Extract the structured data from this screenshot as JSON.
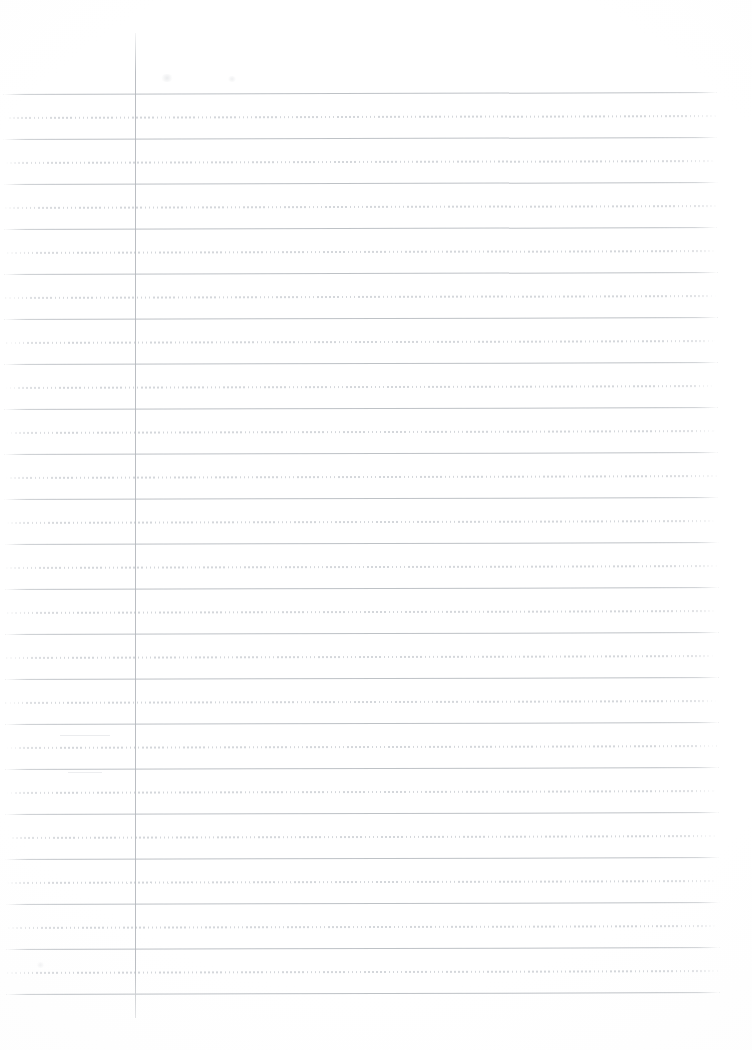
{
  "document": {
    "kind": "lined-notebook-paper-scan",
    "title": "Blank ruled notebook page",
    "page_width": 752,
    "page_height": 1050,
    "background_color": "#fefefe",
    "content_text": "",
    "handwriting_present": false
  },
  "ruling": {
    "solid_line_color": "#b9bdc2",
    "dotted_line_color": "#c9ccd1",
    "margin_line_color": "#b4b8bd",
    "line_pitch_px": 22.5,
    "first_line_y": 93,
    "line_start_x": 5,
    "line_end_x": 718,
    "skew_degrees": -0.16,
    "pattern": [
      "solid",
      "dotted"
    ],
    "margin_line_x": 135,
    "margin_line_top_y": 33,
    "margin_line_bottom_y": 1018,
    "horizontal_rules": [
      {
        "y": 93,
        "type": "solid",
        "x1": 5,
        "x2": 718
      },
      {
        "y": 116,
        "type": "dotted",
        "x1": 6,
        "x2": 717
      },
      {
        "y": 138,
        "type": "solid",
        "x1": 5,
        "x2": 718
      },
      {
        "y": 161,
        "type": "dotted",
        "x1": 7,
        "x2": 716
      },
      {
        "y": 183,
        "type": "solid",
        "x1": 5,
        "x2": 718
      },
      {
        "y": 206,
        "type": "dotted",
        "x1": 6,
        "x2": 719
      },
      {
        "y": 228,
        "type": "solid",
        "x1": 5,
        "x2": 717
      },
      {
        "y": 251,
        "type": "dotted",
        "x1": 8,
        "x2": 716
      },
      {
        "y": 273,
        "type": "solid",
        "x1": 5,
        "x2": 718
      },
      {
        "y": 296,
        "type": "dotted",
        "x1": 6,
        "x2": 717
      },
      {
        "y": 318,
        "type": "solid",
        "x1": 5,
        "x2": 718
      },
      {
        "y": 341,
        "type": "dotted",
        "x1": 7,
        "x2": 716
      },
      {
        "y": 363,
        "type": "solid",
        "x1": 5,
        "x2": 718
      },
      {
        "y": 386,
        "type": "dotted",
        "x1": 6,
        "x2": 715
      },
      {
        "y": 408,
        "type": "solid",
        "x1": 5,
        "x2": 718
      },
      {
        "y": 431,
        "type": "dotted",
        "x1": 7,
        "x2": 716
      },
      {
        "y": 453,
        "type": "solid",
        "x1": 5,
        "x2": 718
      },
      {
        "y": 476,
        "type": "dotted",
        "x1": 6,
        "x2": 717
      },
      {
        "y": 498,
        "type": "solid",
        "x1": 5,
        "x2": 718
      },
      {
        "y": 521,
        "type": "dotted",
        "x1": 7,
        "x2": 714
      },
      {
        "y": 543,
        "type": "solid",
        "x1": 5,
        "x2": 718
      },
      {
        "y": 566,
        "type": "dotted",
        "x1": 6,
        "x2": 716
      },
      {
        "y": 588,
        "type": "solid",
        "x1": 5,
        "x2": 718
      },
      {
        "y": 611,
        "type": "dotted",
        "x1": 7,
        "x2": 715
      },
      {
        "y": 633,
        "type": "solid",
        "x1": 5,
        "x2": 718
      },
      {
        "y": 656,
        "type": "dotted",
        "x1": 6,
        "x2": 714
      },
      {
        "y": 678,
        "type": "solid",
        "x1": 5,
        "x2": 718
      },
      {
        "y": 701,
        "type": "dotted",
        "x1": 5,
        "x2": 716
      },
      {
        "y": 723,
        "type": "solid",
        "x1": 5,
        "x2": 718
      },
      {
        "y": 746,
        "type": "dotted",
        "x1": 6,
        "x2": 716
      },
      {
        "y": 768,
        "type": "solid",
        "x1": 5,
        "x2": 718
      },
      {
        "y": 791,
        "type": "dotted",
        "x1": 6,
        "x2": 715
      },
      {
        "y": 813,
        "type": "solid",
        "x1": 5,
        "x2": 718
      },
      {
        "y": 836,
        "type": "dotted",
        "x1": 7,
        "x2": 714
      },
      {
        "y": 858,
        "type": "solid",
        "x1": 5,
        "x2": 718
      },
      {
        "y": 881,
        "type": "dotted",
        "x1": 6,
        "x2": 716
      },
      {
        "y": 903,
        "type": "solid",
        "x1": 5,
        "x2": 718
      },
      {
        "y": 926,
        "type": "dotted",
        "x1": 7,
        "x2": 715
      },
      {
        "y": 948,
        "type": "solid",
        "x1": 5,
        "x2": 718
      },
      {
        "y": 971,
        "type": "dotted",
        "x1": 6,
        "x2": 716
      },
      {
        "y": 993,
        "type": "solid",
        "x1": 5,
        "x2": 718
      }
    ]
  },
  "scan_artifacts": {
    "marks": [
      {
        "x": 60,
        "y": 735,
        "w": 50,
        "h": 1,
        "opacity": 0.5
      },
      {
        "x": 68,
        "y": 772,
        "w": 34,
        "h": 1,
        "opacity": 0.45
      }
    ],
    "smudges": [
      {
        "x": 160,
        "y": 74,
        "w": 14,
        "h": 8,
        "opacity": 0.5
      },
      {
        "x": 227,
        "y": 76,
        "w": 10,
        "h": 6,
        "opacity": 0.4
      },
      {
        "x": 36,
        "y": 962,
        "w": 9,
        "h": 6,
        "opacity": 0.35
      }
    ]
  }
}
